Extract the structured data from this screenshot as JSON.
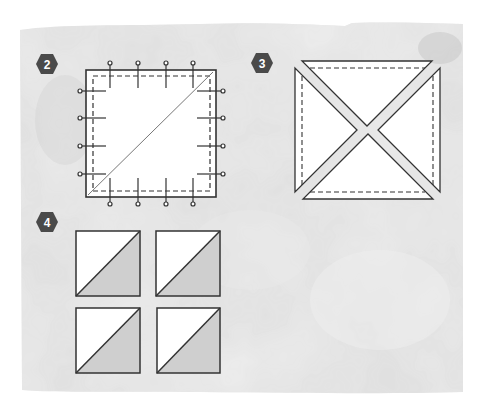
{
  "colors": {
    "background_paper": "#ffffff",
    "watercolor": "#dcdcdc",
    "watercolor_dark": "#c9c9c9",
    "badge_fill": "#4a4a4a",
    "badge_text": "#ffffff",
    "line": "#333333",
    "fabric_white": "#ffffff",
    "fabric_gray": "#cfcfcf"
  },
  "steps": [
    {
      "number": "2",
      "description": "Square with diagonal line, pinned on all sides, stitched around the edge"
    },
    {
      "number": "3",
      "description": "Square cut along both diagonals into four triangles"
    },
    {
      "number": "4",
      "description": "Four half-square triangle units"
    }
  ]
}
